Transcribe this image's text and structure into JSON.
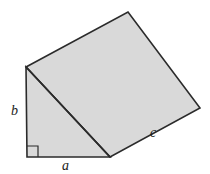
{
  "figure": {
    "background_color": "#ffffff",
    "fill_color": "#d9d9d9",
    "stroke_color": "#2b2b2b",
    "labels": {
      "leg_a": "a",
      "leg_b": "b",
      "hypotenuse_c": "c"
    },
    "right_angle_marker": "right-angle-square"
  },
  "chart_data": {
    "type": "diagram",
    "shapes": [
      {
        "name": "triangle",
        "kind": "polygon",
        "points": [
          [
            26,
            67
          ],
          [
            27,
            157
          ],
          [
            110,
            157
          ]
        ],
        "fill": "#d9d9d9",
        "stroke": "#2b2b2b"
      },
      {
        "name": "square-on-hypotenuse",
        "kind": "polygon",
        "points": [
          [
            26,
            67
          ],
          [
            128,
            12
          ],
          [
            200,
            108
          ],
          [
            110,
            157
          ]
        ],
        "fill": "#d9d9d9",
        "stroke": "#2b2b2b"
      },
      {
        "name": "right-angle-marker",
        "kind": "polyline",
        "points": [
          [
            27,
            146
          ],
          [
            38,
            146
          ],
          [
            38,
            157
          ]
        ],
        "fill": "none",
        "stroke": "#2b2b2b"
      }
    ],
    "annotations": [
      {
        "text": "a",
        "x": 66,
        "y": 166,
        "side": "bottom-leg"
      },
      {
        "text": "b",
        "x": 16,
        "y": 112,
        "side": "left-leg"
      },
      {
        "text": "c",
        "x": 154,
        "y": 133,
        "side": "hypotenuse-outer-edge"
      }
    ],
    "vertices": {
      "apex_top_left": [
        26,
        67
      ],
      "right_angle_corner": [
        27,
        157
      ],
      "bottom_right": [
        110,
        157
      ],
      "square_top": [
        128,
        12
      ],
      "square_right": [
        200,
        108
      ]
    },
    "xlim": [
      0,
      210
    ],
    "ylim": [
      0,
      174
    ],
    "grid": false,
    "legend": false
  }
}
